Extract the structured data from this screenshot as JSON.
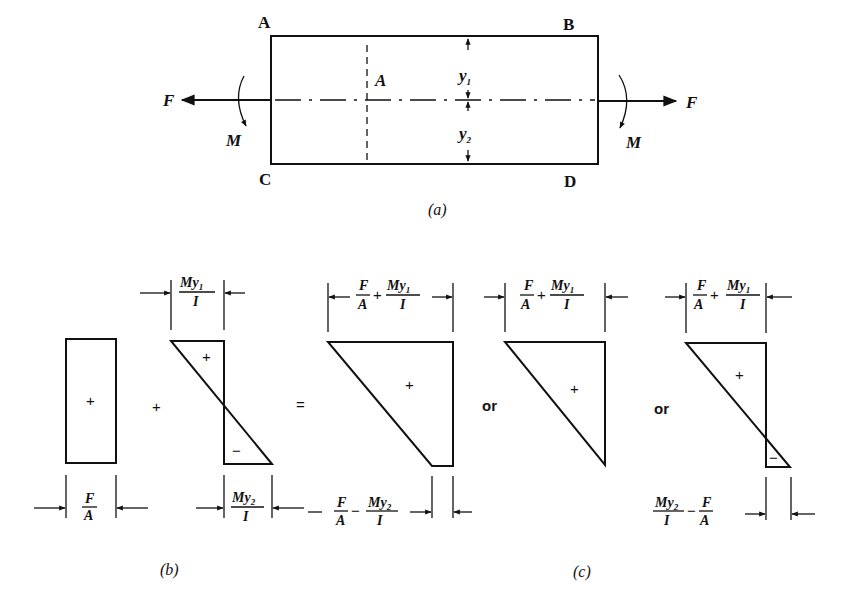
{
  "figure_a": {
    "caption": "(a)",
    "corners": {
      "top_left": "A",
      "top_right": "B",
      "bottom_left": "C",
      "bottom_right": "D"
    },
    "area_label": "A",
    "y_top": "y",
    "y_top_sub": "1",
    "y_bottom": "y",
    "y_bottom_sub": "2",
    "force_left": "F",
    "force_right": "F",
    "moment_left": "M",
    "moment_right": "M"
  },
  "figure_b": {
    "caption": "(b)",
    "axial_sign": "+",
    "plus_operator": "+",
    "bending_top_sign": "+",
    "bending_bottom_sign": "−",
    "axial_dim": {
      "num": "F",
      "den": "A"
    },
    "bend_top_dim": {
      "num": "My",
      "sub": "1",
      "den": "I"
    },
    "bend_bottom_dim": {
      "num": "My",
      "sub": "2",
      "den": "I"
    }
  },
  "figure_c": {
    "caption": "(c)",
    "equals": "=",
    "or_1": "or",
    "or_2": "or",
    "case1": {
      "sign": "+",
      "top_dim": {
        "t1_num": "F",
        "t1_den": "A",
        "op": "+",
        "t2_num": "My",
        "t2_sub": "1",
        "t2_den": "I"
      },
      "bottom_dim": {
        "t1_num": "F",
        "t1_den": "A",
        "op": "−",
        "t2_num": "My",
        "t2_sub": "2",
        "t2_den": "I"
      }
    },
    "case2": {
      "sign": "+",
      "top_dim": {
        "t1_num": "F",
        "t1_den": "A",
        "op": "+",
        "t2_num": "My",
        "t2_sub": "1",
        "t2_den": "I"
      }
    },
    "case3": {
      "top_sign": "+",
      "bottom_sign": "−",
      "top_dim": {
        "t1_num": "F",
        "t1_den": "A",
        "op": "+",
        "t2_num": "My",
        "t2_sub": "1",
        "t2_den": "I"
      },
      "bottom_dim": {
        "t1_num": "My",
        "t1_sub": "2",
        "t1_den": "I",
        "op": "−",
        "t2_num": "F",
        "t2_den": "A"
      }
    }
  },
  "colors": {
    "ink": "#111111",
    "paper": "#ffffff"
  }
}
